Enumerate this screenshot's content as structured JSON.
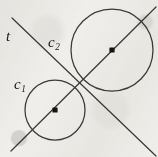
{
  "figure": {
    "kind": "geometry-diagram",
    "background_color": "#f1f0ed",
    "ink_color": "#3a3a3a",
    "labels": [
      {
        "id": "t",
        "text": "t",
        "sub": "",
        "x": 8,
        "y": 36
      },
      {
        "id": "c2",
        "text": "c",
        "sub": "2",
        "x": 50,
        "y": 42
      },
      {
        "id": "c1",
        "text": "c",
        "sub": "1",
        "x": 16,
        "y": 84
      }
    ],
    "circles": [
      {
        "id": "c1",
        "label": "c1",
        "cx": 55,
        "cy": 110,
        "r": 30,
        "center_dot": true
      },
      {
        "id": "c2",
        "label": "c2",
        "cx": 112,
        "cy": 50,
        "r": 41,
        "center_dot": true
      }
    ],
    "lines": [
      {
        "id": "tangent-line-t",
        "label": "t",
        "x1": 12,
        "y1": 18,
        "x2": 156,
        "y2": 156
      },
      {
        "id": "center-line",
        "label": "",
        "x1": 11,
        "y1": 151,
        "x2": 156,
        "y2": 7
      }
    ],
    "tangency_point": {
      "x": 80,
      "y": 87
    },
    "center_dots": [
      {
        "id": "center-dot-c1",
        "x": 55,
        "y": 110
      },
      {
        "id": "center-dot-c2",
        "x": 112,
        "y": 50
      }
    ]
  }
}
